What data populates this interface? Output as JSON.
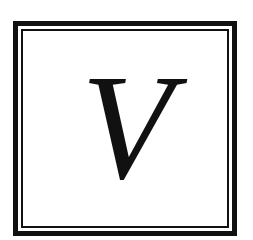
{
  "emblem": {
    "letter": "V",
    "colors": {
      "ink": "#111111",
      "background": "#ffffff"
    }
  }
}
